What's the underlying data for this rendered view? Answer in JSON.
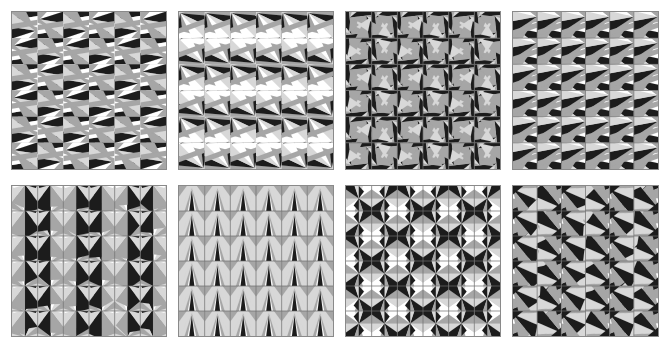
{
  "figure": {
    "title": "",
    "background_color": "#ffffff",
    "width": 669,
    "height": 347,
    "rows": 2,
    "columns": 4,
    "panel_count": 8
  },
  "palette": {
    "black": "#1c1c1c",
    "white": "#ffffff",
    "light_gray": "#d8d8d8",
    "mid_gray": "#a6a6a6",
    "dark_gray": "#8a8a8a",
    "grid_line": "#6f6f6f",
    "panel_border": "#8a8a8a",
    "background": "#ffffff"
  },
  "chart_data": {
    "type": "table",
    "title": "",
    "xlabel": "",
    "ylabel": "",
    "categories": [
      "panel-1",
      "panel-2",
      "panel-3",
      "panel-4",
      "panel-5",
      "panel-6",
      "panel-7",
      "panel-8"
    ],
    "values": [
      6,
      6,
      6,
      6,
      6,
      6,
      6,
      6
    ],
    "legend_position": "none",
    "grid": true
  },
  "panels": [
    {
      "id": "panel-1",
      "label": "",
      "row": 0,
      "col": 0,
      "x": 11,
      "y": 11,
      "width": 156,
      "height": 159,
      "cells_x": 6,
      "cells_y": 6,
      "motif": "skewed-bowtie-wedges",
      "seed": 11,
      "cell_rotation_pattern": "alternating-quadrant",
      "grid_visible": false
    },
    {
      "id": "panel-2",
      "label": "",
      "row": 0,
      "col": 1,
      "x": 178,
      "y": 11,
      "width": 156,
      "height": 159,
      "cells_x": 6,
      "cells_y": 6,
      "motif": "diagonal-sheared-wedges",
      "seed": 23,
      "cell_rotation_pattern": "row-shift",
      "grid_visible": false
    },
    {
      "id": "panel-3",
      "label": "",
      "row": 0,
      "col": 2,
      "x": 345,
      "y": 11,
      "width": 156,
      "height": 159,
      "cells_x": 6,
      "cells_y": 6,
      "motif": "pinwheel-wedges",
      "seed": 37,
      "cell_rotation_pattern": "pinwheel-quadrant",
      "grid_visible": true
    },
    {
      "id": "panel-4",
      "label": "",
      "row": 0,
      "col": 3,
      "x": 512,
      "y": 11,
      "width": 147,
      "height": 159,
      "cells_x": 6,
      "cells_y": 6,
      "motif": "wide-fan-wedges",
      "seed": 53,
      "cell_rotation_pattern": "uniform",
      "grid_visible": true
    },
    {
      "id": "panel-5",
      "label": "",
      "row": 1,
      "col": 0,
      "x": 11,
      "y": 185,
      "width": 156,
      "height": 152,
      "cells_x": 6,
      "cells_y": 6,
      "motif": "radial-wedge-column",
      "seed": 71,
      "cell_rotation_pattern": "column-mirror",
      "grid_visible": true
    },
    {
      "id": "panel-6",
      "label": "",
      "row": 1,
      "col": 1,
      "x": 178,
      "y": 185,
      "width": 156,
      "height": 152,
      "cells_x": 6,
      "cells_y": 6,
      "motif": "arrowhead-arcs",
      "seed": 89,
      "cell_rotation_pattern": "mirror-pairs",
      "grid_visible": true
    },
    {
      "id": "panel-7",
      "label": "",
      "row": 1,
      "col": 2,
      "x": 345,
      "y": 185,
      "width": 156,
      "height": 152,
      "cells_x": 6,
      "cells_y": 6,
      "motif": "star-burst-wedges",
      "seed": 103,
      "cell_rotation_pattern": "four-fold-mirror",
      "grid_visible": true
    },
    {
      "id": "panel-8",
      "label": "",
      "row": 1,
      "col": 3,
      "x": 512,
      "y": 185,
      "width": 147,
      "height": 152,
      "cells_x": 6,
      "cells_y": 6,
      "motif": "dart-and-kite-wedges",
      "seed": 127,
      "cell_rotation_pattern": "column-alternate",
      "grid_visible": true
    }
  ]
}
